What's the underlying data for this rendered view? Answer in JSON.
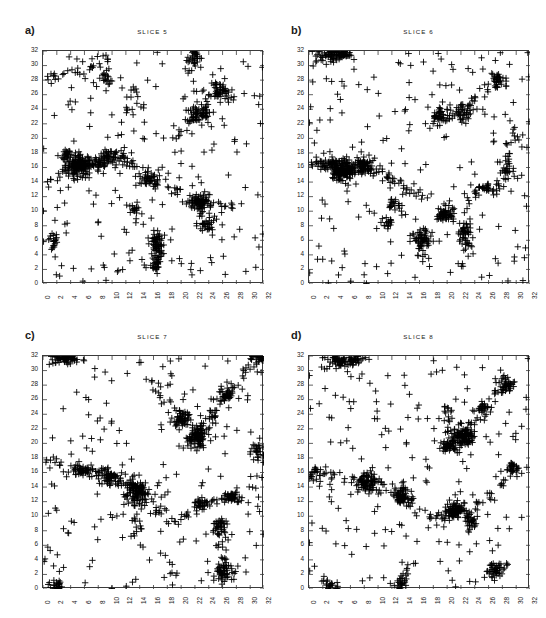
{
  "figure": {
    "background": "#ffffff",
    "marker_color": "#000000",
    "axis_color": "#3a3a3a",
    "width": 546,
    "height": 618
  },
  "panels": [
    {
      "key": "a",
      "label": "a)",
      "title": "SLICE 5",
      "box": {
        "x": 42,
        "y": 50,
        "w": 221,
        "h": 233
      }
    },
    {
      "key": "b",
      "label": "b)",
      "title": "SLICE 6",
      "box": {
        "x": 308,
        "y": 50,
        "w": 221,
        "h": 233
      }
    },
    {
      "key": "c",
      "label": "c)",
      "title": "SLICE 7",
      "box": {
        "x": 42,
        "y": 355,
        "w": 221,
        "h": 233
      }
    },
    {
      "key": "d",
      "label": "d)",
      "title": "SLICE 8",
      "box": {
        "x": 308,
        "y": 355,
        "w": 221,
        "h": 233
      }
    }
  ],
  "chart_data": {
    "type": "scatter",
    "title": "",
    "xlabel": "",
    "ylabel": "",
    "xlim": [
      0,
      32
    ],
    "ylim": [
      0,
      32
    ],
    "grid": false,
    "legend": null,
    "marker": "+",
    "marker_size": 3.2,
    "xticks": [
      0,
      2,
      4,
      6,
      8,
      10,
      12,
      14,
      16,
      18,
      20,
      22,
      24,
      26,
      28,
      30,
      32
    ],
    "yticks": [
      0,
      2,
      4,
      6,
      8,
      10,
      12,
      14,
      16,
      18,
      20,
      22,
      24,
      26,
      28,
      30,
      32
    ],
    "xticklabels": [
      "0",
      "2",
      "4",
      "6",
      "8",
      "10",
      "12",
      "14",
      "16",
      "18",
      "20",
      "22",
      "24",
      "26",
      "28",
      "30",
      "32"
    ],
    "yticklabels": [
      "0",
      "2",
      "4",
      "6",
      "8",
      "10",
      "12",
      "14",
      "16",
      "18",
      "20",
      "22",
      "24",
      "26",
      "28",
      "30",
      "32"
    ],
    "xtick_rotation": -90,
    "panels": [
      {
        "name": "SLICE 5",
        "panel": "a",
        "n_points": 612,
        "clusters": [
          {
            "cx": 5.2,
            "cy": 16.2,
            "n": 120,
            "sx": 0.75,
            "sy": 0.75
          },
          {
            "cx": 3.6,
            "cy": 17.9,
            "n": 26,
            "sx": 0.55,
            "sy": 0.4
          },
          {
            "cx": 8.0,
            "cy": 16.6,
            "n": 34,
            "sx": 0.9,
            "sy": 0.5
          },
          {
            "cx": 10.2,
            "cy": 17.6,
            "n": 30,
            "sx": 1.1,
            "sy": 0.45
          },
          {
            "cx": 22.6,
            "cy": 11.2,
            "n": 70,
            "sx": 0.8,
            "sy": 0.55
          },
          {
            "cx": 23.6,
            "cy": 8.4,
            "n": 34,
            "sx": 0.55,
            "sy": 0.8
          },
          {
            "cx": 22.6,
            "cy": 23.3,
            "n": 52,
            "sx": 0.9,
            "sy": 0.7
          },
          {
            "cx": 25.6,
            "cy": 26.6,
            "n": 40,
            "sx": 0.8,
            "sy": 0.6
          },
          {
            "cx": 16.6,
            "cy": 5.6,
            "n": 42,
            "sx": 0.45,
            "sy": 0.95
          },
          {
            "cx": 16.3,
            "cy": 3.0,
            "n": 26,
            "sx": 0.4,
            "sy": 0.9
          },
          {
            "cx": 15.4,
            "cy": 14.3,
            "n": 32,
            "sx": 0.85,
            "sy": 0.45
          },
          {
            "cx": 1.6,
            "cy": 6.0,
            "n": 18,
            "sx": 0.35,
            "sy": 0.5
          },
          {
            "cx": 13.2,
            "cy": 10.4,
            "n": 16,
            "sx": 0.45,
            "sy": 0.35
          },
          {
            "cx": 9.1,
            "cy": 28.1,
            "n": 18,
            "sx": 0.5,
            "sy": 0.55
          },
          {
            "cx": 21.8,
            "cy": 31.1,
            "n": 20,
            "sx": 0.5,
            "sy": 0.6
          }
        ],
        "filaments": [
          {
            "x0": 0.3,
            "y0": 13.8,
            "x1": 5.0,
            "y1": 16.4,
            "n": 20,
            "w": 0.35
          },
          {
            "x0": 5.4,
            "y0": 16.2,
            "x1": 12.0,
            "y1": 17.4,
            "n": 26,
            "w": 0.45
          },
          {
            "x0": 12.0,
            "y0": 17.2,
            "x1": 16.0,
            "y1": 14.2,
            "n": 20,
            "w": 0.5
          },
          {
            "x0": 16.0,
            "y0": 14.2,
            "x1": 22.4,
            "y1": 11.4,
            "n": 18,
            "w": 0.5
          },
          {
            "x0": 22.8,
            "y0": 11.0,
            "x1": 27.8,
            "y1": 10.6,
            "n": 14,
            "w": 0.4
          },
          {
            "x0": 23.0,
            "y0": 23.6,
            "x1": 26.2,
            "y1": 27.2,
            "n": 16,
            "w": 0.45
          },
          {
            "x0": 18.6,
            "y0": 20.0,
            "x1": 22.0,
            "y1": 23.0,
            "n": 14,
            "w": 0.45
          },
          {
            "x0": 0.5,
            "y0": 28.0,
            "x1": 6.0,
            "y1": 29.6,
            "n": 16,
            "w": 0.5
          },
          {
            "x0": 6.0,
            "y0": 29.6,
            "x1": 10.0,
            "y1": 31.2,
            "n": 14,
            "w": 0.5
          },
          {
            "x0": 20.4,
            "y0": 29.0,
            "x1": 22.4,
            "y1": 31.8,
            "n": 12,
            "w": 0.4
          },
          {
            "x0": 16.4,
            "y0": 2.0,
            "x1": 17.0,
            "y1": 7.0,
            "n": 18,
            "w": 0.4
          },
          {
            "x0": 12.0,
            "y0": 22.0,
            "x1": 13.2,
            "y1": 28.0,
            "n": 14,
            "w": 0.5
          }
        ],
        "random_n": 190
      },
      {
        "name": "SLICE 6",
        "panel": "b",
        "n_points": 604,
        "clusters": [
          {
            "cx": 5.0,
            "cy": 15.6,
            "n": 130,
            "sx": 1.0,
            "sy": 0.7
          },
          {
            "cx": 7.6,
            "cy": 16.3,
            "n": 60,
            "sx": 0.8,
            "sy": 0.6
          },
          {
            "cx": 2.9,
            "cy": 16.4,
            "n": 30,
            "sx": 0.6,
            "sy": 0.45
          },
          {
            "cx": 3.4,
            "cy": 31.4,
            "n": 44,
            "sx": 0.9,
            "sy": 0.5
          },
          {
            "cx": 5.2,
            "cy": 31.6,
            "n": 26,
            "sx": 0.6,
            "sy": 0.4
          },
          {
            "cx": 19.6,
            "cy": 9.4,
            "n": 46,
            "sx": 0.65,
            "sy": 0.55
          },
          {
            "cx": 22.6,
            "cy": 7.0,
            "n": 34,
            "sx": 0.5,
            "sy": 0.9
          },
          {
            "cx": 16.4,
            "cy": 6.2,
            "n": 46,
            "sx": 0.7,
            "sy": 0.6
          },
          {
            "cx": 18.8,
            "cy": 23.4,
            "n": 34,
            "sx": 0.6,
            "sy": 0.7
          },
          {
            "cx": 22.4,
            "cy": 23.6,
            "n": 30,
            "sx": 0.5,
            "sy": 0.6
          },
          {
            "cx": 27.4,
            "cy": 28.0,
            "n": 26,
            "sx": 0.55,
            "sy": 0.5
          },
          {
            "cx": 28.6,
            "cy": 16.0,
            "n": 22,
            "sx": 0.5,
            "sy": 0.6
          },
          {
            "cx": 12.2,
            "cy": 11.0,
            "n": 18,
            "sx": 0.5,
            "sy": 0.4
          },
          {
            "cx": 11.4,
            "cy": 8.4,
            "n": 18,
            "sx": 0.45,
            "sy": 0.5
          },
          {
            "cx": 25.6,
            "cy": 13.0,
            "n": 22,
            "sx": 0.85,
            "sy": 0.35
          }
        ],
        "filaments": [
          {
            "x0": 0.3,
            "y0": 17.0,
            "x1": 4.8,
            "y1": 15.6,
            "n": 18,
            "w": 0.4
          },
          {
            "x0": 5.2,
            "y0": 15.4,
            "x1": 9.0,
            "y1": 16.2,
            "n": 20,
            "w": 0.5
          },
          {
            "x0": 9.0,
            "y0": 16.0,
            "x1": 13.8,
            "y1": 13.2,
            "n": 20,
            "w": 0.5
          },
          {
            "x0": 13.8,
            "y0": 13.2,
            "x1": 18.0,
            "y1": 11.6,
            "n": 14,
            "w": 0.5
          },
          {
            "x0": 18.2,
            "y0": 22.0,
            "x1": 22.6,
            "y1": 24.4,
            "n": 18,
            "w": 0.5
          },
          {
            "x0": 22.8,
            "y0": 24.4,
            "x1": 27.8,
            "y1": 28.4,
            "n": 20,
            "w": 0.5
          },
          {
            "x0": 19.6,
            "y0": 9.8,
            "x1": 25.0,
            "y1": 12.8,
            "n": 18,
            "w": 0.5
          },
          {
            "x0": 25.2,
            "y0": 13.0,
            "x1": 30.8,
            "y1": 15.0,
            "n": 16,
            "w": 0.45
          },
          {
            "x0": 0.4,
            "y0": 31.0,
            "x1": 6.0,
            "y1": 31.8,
            "n": 18,
            "w": 0.5
          },
          {
            "x0": 16.0,
            "y0": 3.0,
            "x1": 16.8,
            "y1": 7.4,
            "n": 14,
            "w": 0.4
          },
          {
            "x0": 22.4,
            "y0": 2.0,
            "x1": 23.0,
            "y1": 8.6,
            "n": 18,
            "w": 0.4
          },
          {
            "x0": 28.4,
            "y0": 17.0,
            "x1": 30.2,
            "y1": 22.0,
            "n": 12,
            "w": 0.45
          }
        ],
        "random_n": 190
      },
      {
        "name": "SLICE 7",
        "panel": "c",
        "n_points": 596,
        "clusters": [
          {
            "cx": 13.6,
            "cy": 13.4,
            "n": 100,
            "sx": 0.85,
            "sy": 0.95
          },
          {
            "cx": 22.4,
            "cy": 21.0,
            "n": 82,
            "sx": 0.6,
            "sy": 0.8
          },
          {
            "cx": 20.2,
            "cy": 23.4,
            "n": 54,
            "sx": 0.7,
            "sy": 0.6
          },
          {
            "cx": 5.8,
            "cy": 16.1,
            "n": 36,
            "sx": 0.8,
            "sy": 0.35
          },
          {
            "cx": 9.4,
            "cy": 15.4,
            "n": 46,
            "sx": 0.7,
            "sy": 0.6
          },
          {
            "cx": 26.2,
            "cy": 2.4,
            "n": 50,
            "sx": 0.7,
            "sy": 0.6
          },
          {
            "cx": 25.6,
            "cy": 8.6,
            "n": 36,
            "sx": 0.5,
            "sy": 0.6
          },
          {
            "cx": 27.4,
            "cy": 12.6,
            "n": 34,
            "sx": 0.8,
            "sy": 0.4
          },
          {
            "cx": 26.6,
            "cy": 26.4,
            "n": 34,
            "sx": 0.6,
            "sy": 0.55
          },
          {
            "cx": 31.0,
            "cy": 18.8,
            "n": 26,
            "sx": 0.5,
            "sy": 0.55
          },
          {
            "cx": 2.8,
            "cy": 31.6,
            "n": 26,
            "sx": 0.7,
            "sy": 0.4
          },
          {
            "cx": 4.0,
            "cy": 31.8,
            "n": 18,
            "sx": 0.5,
            "sy": 0.3
          },
          {
            "cx": 22.8,
            "cy": 11.7,
            "n": 24,
            "sx": 0.7,
            "sy": 0.4
          },
          {
            "cx": 2.0,
            "cy": 0.6,
            "n": 22,
            "sx": 0.6,
            "sy": 0.5
          },
          {
            "cx": 31.2,
            "cy": 31.6,
            "n": 18,
            "sx": 0.5,
            "sy": 0.4
          }
        ],
        "filaments": [
          {
            "x0": 0.4,
            "y0": 18.0,
            "x1": 5.4,
            "y1": 16.2,
            "n": 18,
            "w": 0.45
          },
          {
            "x0": 6.2,
            "y0": 16.2,
            "x1": 9.2,
            "y1": 15.8,
            "n": 16,
            "w": 0.4
          },
          {
            "x0": 9.6,
            "y0": 15.2,
            "x1": 13.4,
            "y1": 13.8,
            "n": 18,
            "w": 0.5
          },
          {
            "x0": 14.0,
            "y0": 13.2,
            "x1": 18.6,
            "y1": 9.0,
            "n": 18,
            "w": 0.55
          },
          {
            "x0": 18.8,
            "y0": 9.0,
            "x1": 23.2,
            "y1": 11.8,
            "n": 16,
            "w": 0.5
          },
          {
            "x0": 23.2,
            "y0": 11.8,
            "x1": 28.0,
            "y1": 12.8,
            "n": 16,
            "w": 0.45
          },
          {
            "x0": 19.8,
            "y0": 19.4,
            "x1": 22.6,
            "y1": 21.4,
            "n": 16,
            "w": 0.5
          },
          {
            "x0": 22.8,
            "y0": 21.6,
            "x1": 27.0,
            "y1": 26.6,
            "n": 20,
            "w": 0.5
          },
          {
            "x0": 27.2,
            "y0": 26.8,
            "x1": 30.8,
            "y1": 31.4,
            "n": 16,
            "w": 0.5
          },
          {
            "x0": 18.8,
            "y0": 24.0,
            "x1": 15.6,
            "y1": 29.4,
            "n": 16,
            "w": 0.5
          },
          {
            "x0": 13.8,
            "y0": 12.6,
            "x1": 13.2,
            "y1": 6.6,
            "n": 16,
            "w": 0.4
          },
          {
            "x0": 26.0,
            "y0": 3.0,
            "x1": 25.8,
            "y1": 8.2,
            "n": 14,
            "w": 0.4
          },
          {
            "x0": 0.5,
            "y0": 31.0,
            "x1": 6.0,
            "y1": 31.8,
            "n": 16,
            "w": 0.5
          }
        ],
        "random_n": 185
      },
      {
        "name": "SLICE 8",
        "panel": "d",
        "n_points": 560,
        "clusters": [
          {
            "cx": 22.2,
            "cy": 21.0,
            "n": 96,
            "sx": 0.75,
            "sy": 0.7
          },
          {
            "cx": 20.4,
            "cy": 19.6,
            "n": 50,
            "sx": 0.7,
            "sy": 0.5
          },
          {
            "cx": 8.4,
            "cy": 14.8,
            "n": 72,
            "sx": 0.75,
            "sy": 0.7
          },
          {
            "cx": 13.6,
            "cy": 12.6,
            "n": 66,
            "sx": 0.6,
            "sy": 0.65
          },
          {
            "cx": 21.0,
            "cy": 10.8,
            "n": 62,
            "sx": 0.6,
            "sy": 0.65
          },
          {
            "cx": 23.4,
            "cy": 9.2,
            "n": 30,
            "sx": 0.45,
            "sy": 0.55
          },
          {
            "cx": 4.2,
            "cy": 31.4,
            "n": 36,
            "sx": 0.6,
            "sy": 0.45
          },
          {
            "cx": 6.6,
            "cy": 31.4,
            "n": 26,
            "sx": 0.7,
            "sy": 0.4
          },
          {
            "cx": 28.6,
            "cy": 28.2,
            "n": 32,
            "sx": 0.6,
            "sy": 0.55
          },
          {
            "cx": 26.8,
            "cy": 2.4,
            "n": 30,
            "sx": 0.7,
            "sy": 0.5
          },
          {
            "cx": 29.4,
            "cy": 16.6,
            "n": 22,
            "sx": 0.55,
            "sy": 0.5
          },
          {
            "cx": 25.2,
            "cy": 25.0,
            "n": 20,
            "sx": 0.5,
            "sy": 0.45
          },
          {
            "cx": 0.8,
            "cy": 15.6,
            "n": 20,
            "sx": 0.5,
            "sy": 0.6
          },
          {
            "cx": 13.4,
            "cy": 0.7,
            "n": 18,
            "sx": 0.5,
            "sy": 0.4
          },
          {
            "cx": 3.2,
            "cy": 0.7,
            "n": 18,
            "sx": 0.6,
            "sy": 0.4
          }
        ],
        "filaments": [
          {
            "x0": 0.5,
            "y0": 15.8,
            "x1": 7.8,
            "y1": 15.0,
            "n": 18,
            "w": 0.5
          },
          {
            "x0": 9.0,
            "y0": 14.6,
            "x1": 13.2,
            "y1": 13.0,
            "n": 16,
            "w": 0.5
          },
          {
            "x0": 14.0,
            "y0": 12.2,
            "x1": 18.4,
            "y1": 9.6,
            "n": 16,
            "w": 0.5
          },
          {
            "x0": 18.6,
            "y0": 9.6,
            "x1": 21.0,
            "y1": 10.8,
            "n": 14,
            "w": 0.45
          },
          {
            "x0": 21.6,
            "y0": 11.0,
            "x1": 27.0,
            "y1": 13.0,
            "n": 18,
            "w": 0.5
          },
          {
            "x0": 22.6,
            "y0": 21.6,
            "x1": 26.0,
            "y1": 25.4,
            "n": 16,
            "w": 0.5
          },
          {
            "x0": 26.2,
            "y0": 25.6,
            "x1": 29.2,
            "y1": 28.6,
            "n": 16,
            "w": 0.45
          },
          {
            "x0": 20.6,
            "y0": 20.0,
            "x1": 19.6,
            "y1": 25.0,
            "n": 16,
            "w": 0.45
          },
          {
            "x0": 27.6,
            "y0": 14.0,
            "x1": 30.4,
            "y1": 16.8,
            "n": 14,
            "w": 0.45
          },
          {
            "x0": 1.0,
            "y0": 31.4,
            "x1": 7.6,
            "y1": 31.6,
            "n": 16,
            "w": 0.5
          },
          {
            "x0": 26.4,
            "y0": 3.0,
            "x1": 29.0,
            "y1": 3.4,
            "n": 12,
            "w": 0.4
          },
          {
            "x0": 13.4,
            "y0": 1.0,
            "x1": 14.0,
            "y1": 4.0,
            "n": 12,
            "w": 0.4
          }
        ],
        "random_n": 180
      }
    ]
  }
}
